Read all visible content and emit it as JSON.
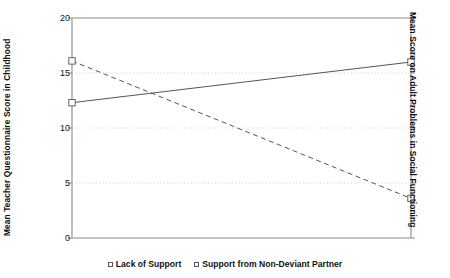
{
  "chart_data": {
    "type": "line",
    "title": "",
    "subtitle": "",
    "categories": [
      "Lack of Support",
      "Support from Non-Deviant Partner"
    ],
    "x": [
      0,
      1
    ],
    "series": [
      {
        "name": "Lack of Support",
        "values": [
          16.1,
          3.6
        ],
        "style": "dashed",
        "marker": "open-square",
        "color": "#55555a"
      },
      {
        "name": "Support from Non-Deviant Partner",
        "values": [
          12.3,
          16.0
        ],
        "style": "solid",
        "marker": "open-square",
        "color": "#55555a"
      }
    ],
    "xlabel": "",
    "ylabel": "Mean Teacher Questionnaire Score in Childhood",
    "ylabel_right": "Mean Score on Adult Problems in Social Functioning",
    "ylim": [
      0,
      20
    ],
    "yticks": [
      0,
      5,
      10,
      15,
      20
    ],
    "ytick_labels": [
      "0",
      "5",
      "10",
      "15",
      "20"
    ],
    "grid": true,
    "grid_style": "dotted",
    "legend_position": "bottom-center",
    "xticks": [],
    "xtick_labels": []
  },
  "axes": {
    "left_title": "Mean Teacher Questionnaire Score in Childhood",
    "right_title": "Mean Score on Adult Problems in Social Functioning"
  },
  "legend": {
    "entries": [
      {
        "label": "Lack of Support"
      },
      {
        "label": "Support from Non-Deviant Partner"
      }
    ]
  },
  "ticks": {
    "labels": [
      "20",
      "15",
      "10",
      "5",
      "0"
    ]
  },
  "colors": {
    "line": "#55555a",
    "axis": "#8a8a8f",
    "grid": "#b9b9c2",
    "text": "#111111",
    "background": "#ffffff"
  }
}
